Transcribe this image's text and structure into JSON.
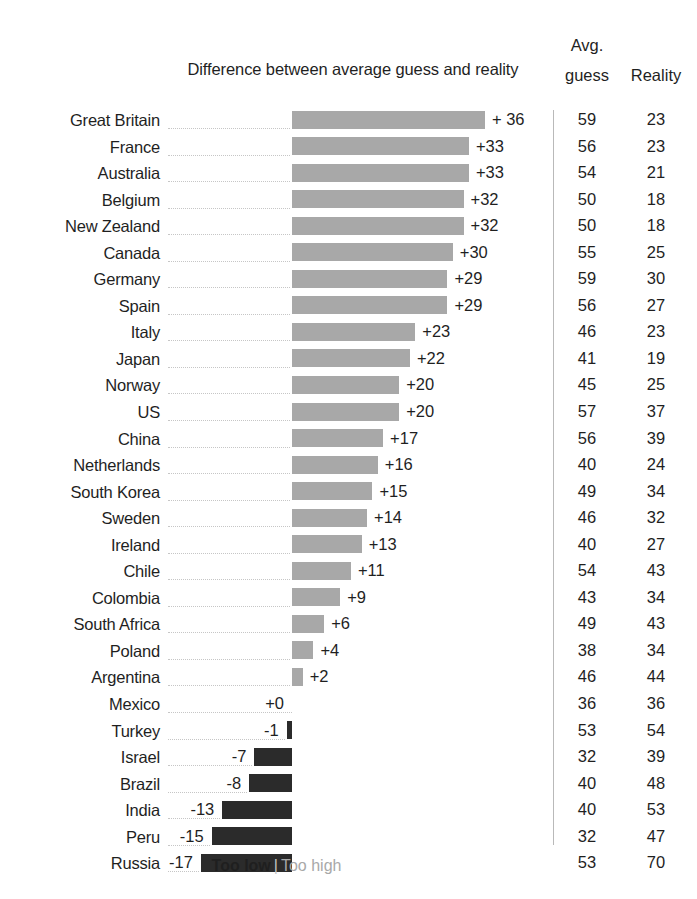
{
  "header": {
    "diff_title": "Difference between average guess and reality",
    "avg_line1": "Avg.",
    "avg_line2": "guess",
    "reality": "Reality"
  },
  "legend": {
    "too_low": "Too low",
    "divider": "|",
    "too_high": "Too high"
  },
  "colors": {
    "positive_bar": "#a8a8a8",
    "negative_bar": "#2b2b2b",
    "leader_line": "#c6c6c6",
    "separator": "#b9b9b9",
    "text": "#1f1f1f"
  },
  "chart_data": {
    "type": "bar",
    "title": "Difference between average guess and reality",
    "xlabel": "",
    "ylabel": "",
    "orientation": "horizontal",
    "grid": false,
    "legend_position": "bottom",
    "legend": [
      {
        "name": "Too low",
        "color": "#2b2b2b"
      },
      {
        "name": "Too high",
        "color": "#a8a8a8"
      }
    ],
    "baseline": 0,
    "xlim": [
      -17,
      36
    ],
    "categories": [
      "Great Britain",
      "France",
      "Australia",
      "Belgium",
      "New Zealand",
      "Canada",
      "Germany",
      "Spain",
      "Italy",
      "Japan",
      "Norway",
      "US",
      "China",
      "Netherlands",
      "South Korea",
      "Sweden",
      "Ireland",
      "Chile",
      "Colombia",
      "South Africa",
      "Poland",
      "Argentina",
      "Mexico",
      "Turkey",
      "Israel",
      "Brazil",
      "India",
      "Peru",
      "Russia"
    ],
    "values": [
      36,
      33,
      33,
      32,
      32,
      30,
      29,
      29,
      23,
      22,
      20,
      20,
      17,
      16,
      15,
      14,
      13,
      11,
      9,
      6,
      4,
      2,
      0,
      -1,
      -7,
      -8,
      -13,
      -15,
      -17
    ],
    "value_labels": [
      "+ 36",
      "+33",
      "+33",
      "+32",
      "+32",
      "+30",
      "+29",
      "+29",
      "+23",
      "+22",
      "+20",
      "+20",
      "+17",
      "+16",
      "+15",
      "+14",
      "+13",
      "+11",
      "+9",
      "+6",
      "+4",
      "+2",
      "+0",
      "-1",
      "-7",
      "-8",
      "-13",
      "-15",
      "-17"
    ],
    "series": [
      {
        "name": "Avg. guess",
        "values": [
          59,
          56,
          54,
          50,
          50,
          55,
          59,
          56,
          46,
          41,
          45,
          57,
          56,
          40,
          49,
          46,
          40,
          54,
          43,
          49,
          38,
          46,
          36,
          53,
          32,
          40,
          40,
          32,
          53
        ]
      },
      {
        "name": "Reality",
        "values": [
          23,
          23,
          21,
          18,
          18,
          25,
          30,
          27,
          23,
          19,
          25,
          37,
          39,
          24,
          34,
          32,
          27,
          43,
          34,
          43,
          34,
          44,
          36,
          54,
          39,
          48,
          53,
          47,
          70
        ]
      }
    ]
  },
  "rows": [
    {
      "country": "Great Britain",
      "delta": "+ 36",
      "value": 36,
      "guess": "59",
      "reality": "23"
    },
    {
      "country": "France",
      "delta": "+33",
      "value": 33,
      "guess": "56",
      "reality": "23"
    },
    {
      "country": "Australia",
      "delta": "+33",
      "value": 33,
      "guess": "54",
      "reality": "21"
    },
    {
      "country": "Belgium",
      "delta": "+32",
      "value": 32,
      "guess": "50",
      "reality": "18"
    },
    {
      "country": "New Zealand",
      "delta": "+32",
      "value": 32,
      "guess": "50",
      "reality": "18"
    },
    {
      "country": "Canada",
      "delta": "+30",
      "value": 30,
      "guess": "55",
      "reality": "25"
    },
    {
      "country": "Germany",
      "delta": "+29",
      "value": 29,
      "guess": "59",
      "reality": "30"
    },
    {
      "country": "Spain",
      "delta": "+29",
      "value": 29,
      "guess": "56",
      "reality": "27"
    },
    {
      "country": "Italy",
      "delta": "+23",
      "value": 23,
      "guess": "46",
      "reality": "23"
    },
    {
      "country": "Japan",
      "delta": "+22",
      "value": 22,
      "guess": "41",
      "reality": "19"
    },
    {
      "country": "Norway",
      "delta": "+20",
      "value": 20,
      "guess": "45",
      "reality": "25"
    },
    {
      "country": "US",
      "delta": "+20",
      "value": 20,
      "guess": "57",
      "reality": "37"
    },
    {
      "country": "China",
      "delta": "+17",
      "value": 17,
      "guess": "56",
      "reality": "39"
    },
    {
      "country": "Netherlands",
      "delta": "+16",
      "value": 16,
      "guess": "40",
      "reality": "24"
    },
    {
      "country": "South Korea",
      "delta": "+15",
      "value": 15,
      "guess": "49",
      "reality": "34"
    },
    {
      "country": "Sweden",
      "delta": "+14",
      "value": 14,
      "guess": "46",
      "reality": "32"
    },
    {
      "country": "Ireland",
      "delta": "+13",
      "value": 13,
      "guess": "40",
      "reality": "27"
    },
    {
      "country": "Chile",
      "delta": "+11",
      "value": 11,
      "guess": "54",
      "reality": "43"
    },
    {
      "country": "Colombia",
      "delta": "+9",
      "value": 9,
      "guess": "43",
      "reality": "34"
    },
    {
      "country": "South Africa",
      "delta": "+6",
      "value": 6,
      "guess": "49",
      "reality": "43"
    },
    {
      "country": "Poland",
      "delta": "+4",
      "value": 4,
      "guess": "38",
      "reality": "34"
    },
    {
      "country": "Argentina",
      "delta": "+2",
      "value": 2,
      "guess": "46",
      "reality": "44"
    },
    {
      "country": "Mexico",
      "delta": "+0",
      "value": 0,
      "guess": "36",
      "reality": "36"
    },
    {
      "country": "Turkey",
      "delta": "-1",
      "value": -1,
      "guess": "53",
      "reality": "54"
    },
    {
      "country": "Israel",
      "delta": "-7",
      "value": -7,
      "guess": "32",
      "reality": "39"
    },
    {
      "country": "Brazil",
      "delta": "-8",
      "value": -8,
      "guess": "40",
      "reality": "48"
    },
    {
      "country": "India",
      "delta": "-13",
      "value": -13,
      "guess": "40",
      "reality": "53"
    },
    {
      "country": "Peru",
      "delta": "-15",
      "value": -15,
      "guess": "32",
      "reality": "47"
    },
    {
      "country": "Russia",
      "delta": "-17",
      "value": -17,
      "guess": "53",
      "reality": "70"
    }
  ]
}
